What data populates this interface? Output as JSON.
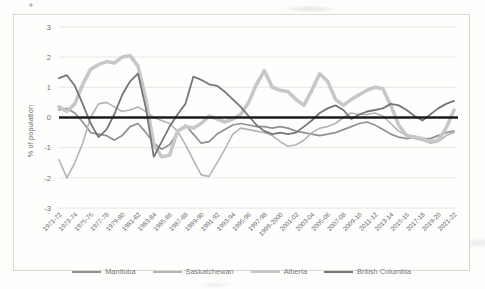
{
  "chart": {
    "title": "",
    "ylabel": "% of population"
  },
  "chart_data": {
    "type": "line",
    "ylabel": "% of population",
    "xlabel": "",
    "ylim": [
      -3,
      3
    ],
    "yticks": [
      3,
      2,
      1,
      0,
      -1,
      -2,
      -3
    ],
    "ytick_labels": [
      "3",
      "2",
      "1",
      "0",
      "-1",
      "-2",
      "-3"
    ],
    "grid": true,
    "legend_position": "bottom",
    "zero_line_color": "#1c1c1c",
    "gridline_color": "#e3e3de",
    "tick_label_color": "#6d6d6d",
    "categories": [
      "1971-72",
      "1972-73",
      "1973-74",
      "1974-75",
      "1975-76",
      "1976-77",
      "1977-78",
      "1978-79",
      "1979-80",
      "1980-81",
      "1981-82",
      "1982-83",
      "1983-84",
      "1984-85",
      "1985-86",
      "1986-87",
      "1987-88",
      "1988-89",
      "1989-90",
      "1990-91",
      "1991-92",
      "1992-93",
      "1993-94",
      "1994-95",
      "1995-96",
      "1996-97",
      "1997-98",
      "1998-99",
      "1999-2000",
      "2000-01",
      "2001-02",
      "2002-03",
      "2003-04",
      "2004-05",
      "2005-06",
      "2006-07",
      "2007-08",
      "2008-09",
      "2009-10",
      "2010-11",
      "2011-12",
      "2012-13",
      "2013-14",
      "2014-15",
      "2015-16",
      "2016-17",
      "2017-18",
      "2018-19",
      "2019-20",
      "2020-21",
      "2021-22"
    ],
    "x_tick_labels": [
      "1971-72",
      "1973-74",
      "1975-76",
      "1977-78",
      "1979-80",
      "1981-82",
      "1983-84",
      "1985-86",
      "1987-88",
      "1989-90",
      "1991-92",
      "1993-94",
      "1995-96",
      "1997-98",
      "1999-2000",
      "2001-02",
      "2003-04",
      "2005-06",
      "2007-08",
      "2009-10",
      "2011-12",
      "2013-14",
      "2015-16",
      "2017-18",
      "2019-20",
      "2021-22"
    ],
    "x_tick_every": 2,
    "series": [
      {
        "name": "Manitoba",
        "color": "#919191",
        "stroke_width": 1.7,
        "values": [
          0.25,
          0.3,
          0.15,
          -0.15,
          -0.5,
          -0.55,
          -0.6,
          -0.75,
          -0.6,
          -0.3,
          -0.2,
          -0.5,
          -0.85,
          -1.05,
          -0.9,
          -0.5,
          -0.25,
          -0.55,
          -0.85,
          -0.8,
          -0.55,
          -0.4,
          -0.25,
          -0.2,
          -0.25,
          -0.3,
          -0.3,
          -0.35,
          -0.3,
          -0.35,
          -0.45,
          -0.5,
          -0.55,
          -0.6,
          -0.55,
          -0.5,
          -0.4,
          -0.3,
          -0.2,
          -0.15,
          -0.25,
          -0.4,
          -0.55,
          -0.65,
          -0.7,
          -0.65,
          -0.7,
          -0.7,
          -0.6,
          -0.5,
          -0.45
        ]
      },
      {
        "name": "Saskatchewan",
        "color": "#b4b4b4",
        "stroke_width": 1.6,
        "values": [
          -1.4,
          -2.0,
          -1.5,
          -0.85,
          0.0,
          0.45,
          0.5,
          0.35,
          0.2,
          0.25,
          0.35,
          0.2,
          0.0,
          -0.1,
          -0.2,
          -0.45,
          -0.9,
          -1.4,
          -1.9,
          -1.95,
          -1.5,
          -1.05,
          -0.55,
          -0.35,
          -0.4,
          -0.45,
          -0.5,
          -0.6,
          -0.8,
          -0.95,
          -0.9,
          -0.75,
          -0.5,
          -0.35,
          -0.3,
          -0.2,
          0.0,
          0.15,
          0.1,
          0.1,
          0.15,
          0.05,
          -0.2,
          -0.45,
          -0.6,
          -0.7,
          -0.75,
          -0.85,
          -0.8,
          -0.6,
          -0.5
        ]
      },
      {
        "name": "Alberta",
        "color": "#c7c7c7",
        "stroke_width": 3.6,
        "values": [
          0.35,
          0.2,
          0.45,
          1.1,
          1.6,
          1.75,
          1.85,
          1.8,
          2.0,
          2.05,
          1.7,
          0.6,
          -0.9,
          -1.3,
          -1.25,
          -0.45,
          -0.3,
          -0.35,
          -0.2,
          0.05,
          -0.05,
          -0.15,
          -0.05,
          0.1,
          0.5,
          1.1,
          1.55,
          1.0,
          0.9,
          0.85,
          0.6,
          0.4,
          0.9,
          1.45,
          1.2,
          0.6,
          0.4,
          0.6,
          0.75,
          0.9,
          1.0,
          0.95,
          0.4,
          -0.25,
          -0.6,
          -0.65,
          -0.7,
          -0.8,
          -0.75,
          -0.35,
          0.25
        ]
      },
      {
        "name": "British Columbia",
        "color": "#767676",
        "stroke_width": 1.8,
        "values": [
          1.3,
          1.4,
          1.05,
          0.45,
          -0.2,
          -0.65,
          -0.4,
          0.1,
          0.75,
          1.2,
          1.45,
          0.3,
          -1.3,
          -0.8,
          -0.3,
          0.1,
          0.45,
          1.35,
          1.25,
          1.1,
          1.05,
          0.85,
          0.6,
          0.35,
          0.05,
          -0.25,
          -0.45,
          -0.55,
          -0.5,
          -0.55,
          -0.5,
          -0.3,
          -0.1,
          0.15,
          0.3,
          0.4,
          0.25,
          -0.05,
          0.1,
          0.2,
          0.25,
          0.3,
          0.45,
          0.4,
          0.25,
          0.05,
          -0.1,
          0.1,
          0.3,
          0.45,
          0.55
        ]
      }
    ]
  }
}
